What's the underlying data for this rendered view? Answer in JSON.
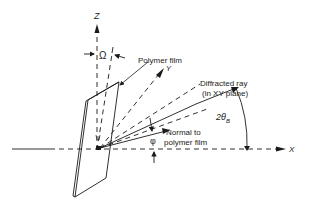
{
  "diagram": {
    "type": "geometry-schematic",
    "axes": {
      "z": "Z",
      "y": "Y",
      "x": "X"
    },
    "labels": {
      "omega": "Ω",
      "polymer_film": "Polymer film",
      "diffracted_ray_line1": "Diffracted ray",
      "diffracted_ray_line2": "(in XY plane)",
      "two_theta": "2θ",
      "two_theta_sub": "B",
      "normal_line1": "Normal to",
      "normal_line2": "polymer film",
      "phi": "φ"
    },
    "colors": {
      "ink": "#1a1a1a",
      "background": "#ffffff"
    }
  }
}
